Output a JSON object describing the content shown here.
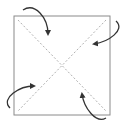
{
  "diagram": {
    "type": "origami-fold-diagram",
    "colors": {
      "paper_edge": "#8a8a8a",
      "fold_line": "#9a9a9a",
      "arrow": "#333333",
      "background": "#ffffff"
    },
    "square": {
      "x": 14,
      "y": 16,
      "width": 96,
      "height": 99
    },
    "fold_lines": [
      {
        "name": "diagonal-tl-br",
        "style": "dashed",
        "from": [
          18,
          20
        ],
        "to": [
          106,
          111
        ]
      },
      {
        "name": "diagonal-tr-bl",
        "style": "dashed",
        "from": [
          106,
          20
        ],
        "to": [
          18,
          111
        ]
      }
    ],
    "arrows": [
      {
        "name": "top-left-corner-fold",
        "path": "M 23 10 C 35 2, 48 18, 48 34"
      },
      {
        "name": "top-right-corner-fold",
        "path": "M 116 21 C 126 30, 108 42, 94 44"
      },
      {
        "name": "bottom-left-corner-fold",
        "path": "M 10 108 C 0 98, 20 86, 34 86"
      },
      {
        "name": "bottom-right-corner-fold",
        "path": "M 106 118 C 96 124, 84 108, 82 94"
      }
    ]
  }
}
